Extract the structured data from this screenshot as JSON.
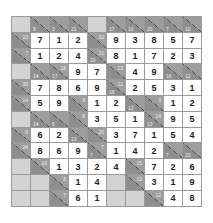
{
  "puzzle": {
    "type": "kakuro",
    "rows": 12,
    "cols": 10,
    "grid": [
      [
        {
          "t": "b"
        },
        {
          "t": "c",
          "d": "8"
        },
        {
          "t": "c",
          "d": "3"
        },
        {
          "t": "c",
          "d": "21"
        },
        {
          "t": "b"
        },
        {
          "t": "c",
          "d": "17"
        },
        {
          "t": "c",
          "d": "10"
        },
        {
          "t": "c",
          "d": "20"
        },
        {
          "t": "c",
          "d": "7"
        },
        {
          "t": "c",
          "d": "10"
        }
      ],
      [
        {
          "t": "c",
          "r": "10"
        },
        {
          "t": "v",
          "v": "7"
        },
        {
          "t": "v",
          "v": "1"
        },
        {
          "t": "v",
          "v": "2"
        },
        {
          "t": "c",
          "r": "32"
        },
        {
          "t": "v",
          "v": "9"
        },
        {
          "t": "v",
          "v": "3"
        },
        {
          "t": "v",
          "v": "8"
        },
        {
          "t": "v",
          "v": "5"
        },
        {
          "t": "v",
          "v": "7"
        }
      ],
      [
        {
          "t": "c",
          "r": "7"
        },
        {
          "t": "v",
          "v": "1"
        },
        {
          "t": "v",
          "v": "2"
        },
        {
          "t": "v",
          "v": "4"
        },
        {
          "t": "c",
          "d": "20",
          "r": "21"
        },
        {
          "t": "v",
          "v": "8"
        },
        {
          "t": "v",
          "v": "1"
        },
        {
          "t": "v",
          "v": "7"
        },
        {
          "t": "v",
          "v": "2"
        },
        {
          "t": "v",
          "v": "3"
        }
      ],
      [
        {
          "t": "b"
        },
        {
          "t": "c",
          "d": "14"
        },
        {
          "t": "c",
          "d": "17",
          "r": "18"
        },
        {
          "t": "v",
          "v": "9"
        },
        {
          "t": "v",
          "v": "7"
        },
        {
          "t": "c",
          "r": "13"
        },
        {
          "t": "v",
          "v": "4"
        },
        {
          "t": "v",
          "v": "9"
        },
        {
          "t": "c",
          "d": "16"
        },
        {
          "t": "c",
          "d": "12"
        }
      ],
      [
        {
          "t": "c",
          "r": "30"
        },
        {
          "t": "v",
          "v": "7"
        },
        {
          "t": "v",
          "v": "8"
        },
        {
          "t": "v",
          "v": "6"
        },
        {
          "t": "v",
          "v": "9"
        },
        {
          "t": "c",
          "d": "16",
          "r": "11"
        },
        {
          "t": "v",
          "v": "2"
        },
        {
          "t": "v",
          "v": "5"
        },
        {
          "t": "v",
          "v": "3"
        },
        {
          "t": "v",
          "v": "1"
        }
      ],
      [
        {
          "t": "c",
          "r": "14"
        },
        {
          "t": "v",
          "v": "5"
        },
        {
          "t": "v",
          "v": "9"
        },
        {
          "t": "c",
          "r": "9"
        },
        {
          "t": "v",
          "v": "1"
        },
        {
          "t": "v",
          "v": "2"
        },
        {
          "t": "c",
          "d": "12"
        },
        {
          "t": "c",
          "r": "3"
        },
        {
          "t": "v",
          "v": "1"
        },
        {
          "t": "v",
          "v": "2"
        }
      ],
      [
        {
          "t": "b"
        },
        {
          "t": "c",
          "d": "14"
        },
        {
          "t": "c",
          "d": "6"
        },
        {
          "t": "c",
          "r": "8"
        },
        {
          "t": "v",
          "v": "3"
        },
        {
          "t": "v",
          "v": "5"
        },
        {
          "t": "v",
          "v": "1"
        },
        {
          "t": "c",
          "d": "13",
          "r": "14"
        },
        {
          "t": "v",
          "v": "9"
        },
        {
          "t": "v",
          "v": "5"
        }
      ],
      [
        {
          "t": "c",
          "r": "8"
        },
        {
          "t": "v",
          "v": "6"
        },
        {
          "t": "v",
          "v": "2"
        },
        {
          "t": "c",
          "d": "13"
        },
        {
          "t": "c",
          "r": "20"
        },
        {
          "t": "v",
          "v": "3"
        },
        {
          "t": "v",
          "v": "7"
        },
        {
          "t": "v",
          "v": "1"
        },
        {
          "t": "v",
          "v": "5"
        },
        {
          "t": "v",
          "v": "4"
        }
      ],
      [
        {
          "t": "c",
          "r": "24"
        },
        {
          "t": "v",
          "v": "8"
        },
        {
          "t": "v",
          "v": "6"
        },
        {
          "t": "v",
          "v": "9"
        },
        {
          "t": "c",
          "d": "7",
          "r": "7"
        },
        {
          "t": "v",
          "v": "1"
        },
        {
          "t": "v",
          "v": "4"
        },
        {
          "t": "v",
          "v": "2"
        },
        {
          "t": "c",
          "d": "7"
        },
        {
          "t": "c",
          "d": "23"
        }
      ],
      [
        {
          "t": "b"
        },
        {
          "t": "c",
          "r": "10"
        },
        {
          "t": "v",
          "v": "1"
        },
        {
          "t": "v",
          "v": "3"
        },
        {
          "t": "v",
          "v": "2"
        },
        {
          "t": "v",
          "v": "4"
        },
        {
          "t": "c",
          "r": "15"
        },
        {
          "t": "v",
          "v": "7"
        },
        {
          "t": "v",
          "v": "2"
        },
        {
          "t": "v",
          "v": "6"
        }
      ],
      [
        {
          "t": "b"
        },
        {
          "t": "b"
        },
        {
          "t": "c",
          "r": "8"
        },
        {
          "t": "v",
          "v": "1"
        },
        {
          "t": "v",
          "v": "4"
        },
        {
          "t": "b"
        },
        {
          "t": "c",
          "r": "13"
        },
        {
          "t": "v",
          "v": "3"
        },
        {
          "t": "v",
          "v": "1"
        },
        {
          "t": "v",
          "v": "9"
        }
      ],
      [
        {
          "t": "b"
        },
        {
          "t": "b"
        },
        {
          "t": "c",
          "r": "7"
        },
        {
          "t": "v",
          "v": "6"
        },
        {
          "t": "v",
          "v": "1"
        },
        {
          "t": "b"
        },
        {
          "t": "b"
        },
        {
          "t": "c",
          "r": "12"
        },
        {
          "t": "v",
          "v": "4"
        },
        {
          "t": "v",
          "v": "8"
        }
      ]
    ]
  }
}
